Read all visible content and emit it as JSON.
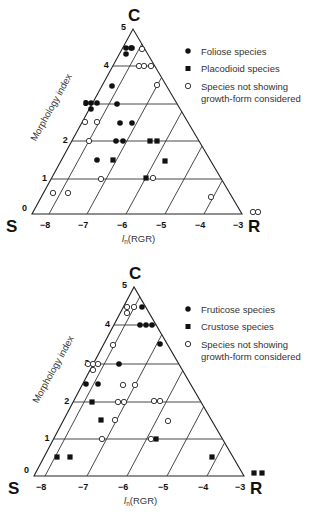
{
  "chart_data": [
    {
      "type": "scatter",
      "subtype": "ternary-csr",
      "title": "",
      "vertices": {
        "top": "C",
        "left": "S",
        "right": "R"
      },
      "ylabel": "Morphology index",
      "xlabel": "ln(RGR)",
      "y_ticks": [
        "0",
        "1",
        "2",
        "3",
        "4",
        "5"
      ],
      "x_ticks": [
        "−8",
        "−7",
        "−6",
        "−5",
        "−4",
        "−3"
      ],
      "ylim": [
        0,
        5
      ],
      "xlim": [
        -8.4,
        -3
      ],
      "legend_position": "upper right",
      "legend": [
        {
          "marker": "filled-circle",
          "label": "Foliose species"
        },
        {
          "marker": "filled-square",
          "label": "Placodioid species"
        },
        {
          "marker": "open-circle",
          "label": "Species not showing growth-form considered"
        }
      ],
      "series": [
        {
          "name": "Foliose species",
          "marker": "filled-circle",
          "points": [
            {
              "px": 126,
              "py": 48,
              "morph": 4.5,
              "lnRGR": -6.2
            },
            {
              "px": 131,
              "py": 48,
              "morph": 4.5,
              "lnRGR": -6.1
            },
            {
              "px": 126,
              "py": 54,
              "morph": 4.3,
              "lnRGR": -6.2
            },
            {
              "px": 132,
              "py": 48,
              "morph": 4.5,
              "lnRGR": -6.05
            },
            {
              "px": 112,
              "py": 86,
              "morph": 3.5,
              "lnRGR": -6.4
            },
            {
              "px": 86,
              "py": 103,
              "morph": 3.0,
              "lnRGR": -7.1
            },
            {
              "px": 91,
              "py": 103,
              "morph": 3.0,
              "lnRGR": -6.95
            },
            {
              "px": 97,
              "py": 103,
              "morph": 3.0,
              "lnRGR": -6.8
            },
            {
              "px": 91,
              "py": 109,
              "morph": 2.85,
              "lnRGR": -6.95
            },
            {
              "px": 117,
              "py": 104,
              "morph": 3.0,
              "lnRGR": -6.3
            },
            {
              "px": 120,
              "py": 123,
              "morph": 2.5,
              "lnRGR": -6.2
            },
            {
              "px": 132,
              "py": 123,
              "morph": 2.5,
              "lnRGR": -5.85
            },
            {
              "px": 116,
              "py": 141,
              "morph": 2.0,
              "lnRGR": -6.3
            },
            {
              "px": 123,
              "py": 141,
              "morph": 2.0,
              "lnRGR": -6.1
            },
            {
              "px": 97,
              "py": 160,
              "morph": 1.5,
              "lnRGR": -6.8
            }
          ]
        },
        {
          "name": "Placodioid species",
          "marker": "filled-square",
          "points": [
            {
              "px": 150,
              "py": 141,
              "morph": 2.0,
              "lnRGR": -5.4
            },
            {
              "px": 157,
              "py": 141,
              "morph": 2.0,
              "lnRGR": -5.25
            },
            {
              "px": 113,
              "py": 160,
              "morph": 1.5,
              "lnRGR": -6.3
            },
            {
              "px": 165,
              "py": 161,
              "morph": 1.5,
              "lnRGR": -4.9
            },
            {
              "px": 146,
              "py": 178,
              "morph": 1.0,
              "lnRGR": -5.5
            }
          ]
        },
        {
          "name": "Species not showing growth-form considered",
          "marker": "open-circle",
          "points": [
            {
              "px": 142,
              "py": 49,
              "morph": 4.5,
              "lnRGR": -5.65
            },
            {
              "px": 139,
              "py": 66,
              "morph": 4.0,
              "lnRGR": -5.55
            },
            {
              "px": 144,
              "py": 66,
              "morph": 4.0,
              "lnRGR": -5.45
            },
            {
              "px": 151,
              "py": 66,
              "morph": 4.0,
              "lnRGR": -5.3
            },
            {
              "px": 157,
              "py": 85,
              "morph": 3.5,
              "lnRGR": -5.15
            },
            {
              "px": 85,
              "py": 122,
              "morph": 2.5,
              "lnRGR": -7.1
            },
            {
              "px": 97,
              "py": 122,
              "morph": 2.5,
              "lnRGR": -6.8
            },
            {
              "px": 89,
              "py": 141,
              "morph": 2.0,
              "lnRGR": -7.0
            },
            {
              "px": 101,
              "py": 179,
              "morph": 1.0,
              "lnRGR": -6.6
            },
            {
              "px": 153,
              "py": 178,
              "morph": 1.0,
              "lnRGR": -5.3
            },
            {
              "px": 53,
              "py": 193,
              "morph": 0.6,
              "lnRGR": -7.9
            },
            {
              "px": 68,
              "py": 193,
              "morph": 0.6,
              "lnRGR": -7.5
            },
            {
              "px": 211,
              "py": 197,
              "morph": 0.5,
              "lnRGR": -3.8
            },
            {
              "px": 253,
              "py": 212,
              "morph": 0.0,
              "lnRGR": -2.7
            },
            {
              "px": 258,
              "py": 212,
              "morph": 0.0,
              "lnRGR": -2.6
            }
          ]
        }
      ]
    },
    {
      "type": "scatter",
      "subtype": "ternary-csr",
      "title": "",
      "vertices": {
        "top": "C",
        "left": "S",
        "right": "R"
      },
      "ylabel": "Morphology index",
      "xlabel": "ln(RGR)",
      "y_ticks": [
        "0",
        "1",
        "2",
        "3",
        "4",
        "5"
      ],
      "x_ticks": [
        "−8",
        "−7",
        "−6",
        "−5",
        "−4",
        "−3"
      ],
      "ylim": [
        0,
        5
      ],
      "xlim": [
        -8.4,
        -3
      ],
      "legend_position": "upper right",
      "legend": [
        {
          "marker": "filled-circle",
          "label": "Fruticose species"
        },
        {
          "marker": "filled-square",
          "label": "Crustose species"
        },
        {
          "marker": "open-circle",
          "label": "Species not showing growth-form considered"
        }
      ],
      "series": [
        {
          "name": "Fruticose species",
          "marker": "filled-circle",
          "points": [
            {
              "px": 142,
              "py": 307,
              "morph": 4.5,
              "lnRGR": -5.75
            },
            {
              "px": 140,
              "py": 325,
              "morph": 4.0,
              "lnRGR": -5.7
            },
            {
              "px": 146,
              "py": 325,
              "morph": 4.0,
              "lnRGR": -5.55
            },
            {
              "px": 152,
              "py": 325,
              "morph": 4.0,
              "lnRGR": -5.4
            },
            {
              "px": 160,
              "py": 344,
              "morph": 3.5,
              "lnRGR": -5.2
            },
            {
              "px": 119,
              "py": 364,
              "morph": 3.0,
              "lnRGR": -6.25
            },
            {
              "px": 86,
              "py": 384,
              "morph": 2.5,
              "lnRGR": -7.05
            },
            {
              "px": 98,
              "py": 384,
              "morph": 2.5,
              "lnRGR": -6.75
            }
          ]
        },
        {
          "name": "Crustose species",
          "marker": "filled-square",
          "points": [
            {
              "px": 92,
              "py": 402,
              "morph": 2.0,
              "lnRGR": -6.9
            },
            {
              "px": 101,
              "py": 420,
              "morph": 1.5,
              "lnRGR": -6.65
            },
            {
              "px": 156,
              "py": 439,
              "morph": 1.0,
              "lnRGR": -5.3
            },
            {
              "px": 57,
              "py": 457,
              "morph": 0.5,
              "lnRGR": -7.8
            },
            {
              "px": 70,
              "py": 457,
              "morph": 0.5,
              "lnRGR": -7.45
            },
            {
              "px": 212,
              "py": 457,
              "morph": 0.5,
              "lnRGR": -3.85
            },
            {
              "px": 254,
              "py": 473,
              "morph": 0.0,
              "lnRGR": -2.7
            },
            {
              "px": 262,
              "py": 473,
              "morph": 0.0,
              "lnRGR": -2.55
            }
          ]
        },
        {
          "name": "Species not showing growth-form considered",
          "marker": "open-circle",
          "points": [
            {
              "px": 127,
              "py": 307,
              "morph": 4.5,
              "lnRGR": -6.2
            },
            {
              "px": 134,
              "py": 307,
              "morph": 4.5,
              "lnRGR": -6.05
            },
            {
              "px": 127,
              "py": 313,
              "morph": 4.3,
              "lnRGR": -6.2
            },
            {
              "px": 113,
              "py": 345,
              "morph": 3.5,
              "lnRGR": -6.4
            },
            {
              "px": 88,
              "py": 364,
              "morph": 3.0,
              "lnRGR": -7.0
            },
            {
              "px": 93,
              "py": 364,
              "morph": 3.0,
              "lnRGR": -6.9
            },
            {
              "px": 98,
              "py": 364,
              "morph": 3.0,
              "lnRGR": -6.8
            },
            {
              "px": 93,
              "py": 370,
              "morph": 2.85,
              "lnRGR": -6.9
            },
            {
              "px": 123,
              "py": 385,
              "morph": 2.5,
              "lnRGR": -6.1
            },
            {
              "px": 135,
              "py": 385,
              "morph": 2.5,
              "lnRGR": -5.85
            },
            {
              "px": 118,
              "py": 402,
              "morph": 2.0,
              "lnRGR": -6.25
            },
            {
              "px": 124,
              "py": 402,
              "morph": 2.0,
              "lnRGR": -6.1
            },
            {
              "px": 154,
              "py": 401,
              "morph": 2.0,
              "lnRGR": -5.35
            },
            {
              "px": 160,
              "py": 401,
              "morph": 2.0,
              "lnRGR": -5.2
            },
            {
              "px": 115,
              "py": 420,
              "morph": 1.5,
              "lnRGR": -6.3
            },
            {
              "px": 168,
              "py": 421,
              "morph": 1.5,
              "lnRGR": -4.95
            },
            {
              "px": 102,
              "py": 439,
              "morph": 1.0,
              "lnRGR": -6.6
            },
            {
              "px": 151,
              "py": 439,
              "morph": 1.0,
              "lnRGR": -5.4
            }
          ]
        }
      ]
    }
  ],
  "figures": [
    {
      "geometry": {
        "S": [
          32,
          214
        ],
        "R": [
          242,
          214
        ],
        "C": [
          133,
          29
        ],
        "levels_y": [
          214,
          179,
          141,
          104,
          66,
          29
        ],
        "rgr_x": [
          49,
          87,
          126,
          165,
          204,
          242
        ]
      },
      "labels": {
        "C": "C",
        "S": "S",
        "R": "R",
        "ylabel": "Morphology index",
        "xlabel_main": "l",
        "xlabel_sub": "n",
        "xlabel_rest": "(RGR)"
      },
      "legend_items": [
        "Foliose species",
        "Placodioid species",
        "Species not showing",
        "growth-form considered"
      ]
    },
    {
      "geometry": {
        "S": [
          34,
          476
        ],
        "R": [
          244,
          476
        ],
        "C": [
          134,
          287
        ],
        "levels_y": [
          476,
          439,
          402,
          364,
          325,
          287
        ],
        "rgr_x": [
          45,
          87,
          127,
          167,
          207,
          244
        ]
      },
      "labels": {
        "C": "C",
        "S": "S",
        "R": "R",
        "ylabel": "Morphology index",
        "xlabel_main": "l",
        "xlabel_sub": "n",
        "xlabel_rest": "(RGR)"
      },
      "legend_items": [
        "Fruticose species",
        "Crustose species",
        "Species not showing",
        "growth-form considered"
      ]
    }
  ],
  "colors": {
    "ink": "#111111",
    "line": "#222222",
    "text": "#333333",
    "background": "#ffffff"
  }
}
